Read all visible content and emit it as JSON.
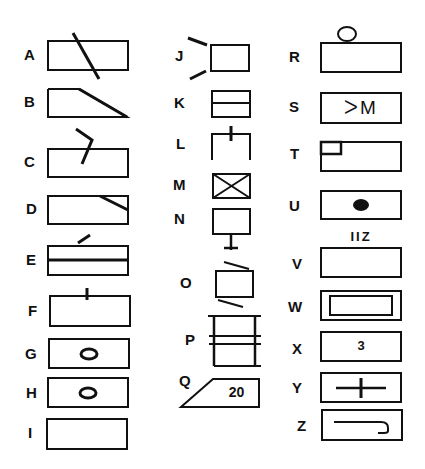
{
  "figure": {
    "stroke_color": "#111111",
    "background": "#ffffff"
  },
  "symbols": {
    "A": {
      "label": "A",
      "shape": "rectangle with diagonal line crossing through"
    },
    "B": {
      "label": "B",
      "shape": "trapezoid with sloped right side"
    },
    "C": {
      "label": "C",
      "shape": "rectangle with bent line entering from top"
    },
    "D": {
      "label": "D",
      "shape": "rectangle with diagonal line in upper-right corner"
    },
    "E": {
      "label": "E",
      "shape": "rectangle split by horizontal line with slash above"
    },
    "F": {
      "label": "F",
      "shape": "rectangle with short vertical tick on top edge"
    },
    "G": {
      "label": "G",
      "shape": "rectangle with small circle inside"
    },
    "H": {
      "label": "H",
      "shape": "rectangle with small circle inside"
    },
    "I": {
      "label": "I",
      "shape": "plain rectangle"
    },
    "J": {
      "label": "J",
      "shape": "small square with two diverging lines on left"
    },
    "K": {
      "label": "K",
      "shape": "small square split by horizontal line"
    },
    "L": {
      "label": "L",
      "shape": "open-bottom square with vertical tick on top"
    },
    "M": {
      "label": "M",
      "shape": "small square with X inside"
    },
    "N": {
      "label": "N",
      "shape": "small square with stem and cross below"
    },
    "O": {
      "label": "O",
      "shape": "small square with slanted lines above and below"
    },
    "P": {
      "label": "P",
      "shape": "tall rectangle with double horizontal lines and extended rails"
    },
    "Q": {
      "label": "Q",
      "shape": "trapezoid with sloped left side",
      "text": "20"
    },
    "R": {
      "label": "R",
      "shape": "rectangle with small circle on top"
    },
    "S": {
      "label": "S",
      "shape": "rectangle with glyphs",
      "text": "ᐳM"
    },
    "T": {
      "label": "T",
      "shape": "rectangle with small square in upper-left corner"
    },
    "U": {
      "label": "U",
      "shape": "rectangle with filled dot"
    },
    "V": {
      "label": "V",
      "shape": "plain rectangle with text above",
      "text_above": "IIZ"
    },
    "W": {
      "label": "W",
      "shape": "double-bordered rectangle"
    },
    "X": {
      "label": "X",
      "shape": "rectangle with number",
      "text": "3"
    },
    "Y": {
      "label": "Y",
      "shape": "rectangle with cross"
    },
    "Z": {
      "label": "Z",
      "shape": "rectangle with hook line"
    }
  }
}
